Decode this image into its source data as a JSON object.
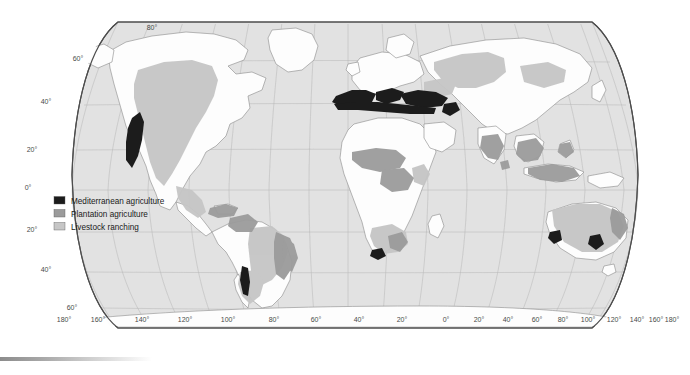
{
  "map": {
    "title": "World agricultural regions",
    "projection": "Robinson",
    "colors": {
      "ocean": "#e2e2e2",
      "land": "#fdfdfd",
      "border": "#8a8a8a",
      "graticule": "#b9b9b9",
      "frame": "#4d4d4d",
      "mediterranean": "#1c1c1c",
      "plantation": "#9b9b9b",
      "ranching": "#c6c6c6"
    },
    "legend": {
      "items": [
        {
          "label": "Mediterranean agriculture",
          "color": "#1c1c1c",
          "key": "mediterranean"
        },
        {
          "label": "Plantation agriculture",
          "color": "#9b9b9b",
          "key": "plantation"
        },
        {
          "label": "Livestock ranching",
          "color": "#c6c6c6",
          "key": "ranching"
        }
      ]
    },
    "latitude_labels": [
      {
        "text": "80°",
        "x": 152,
        "y": 30
      },
      {
        "text": "60°",
        "x": 78,
        "y": 61
      },
      {
        "text": "40°",
        "x": 46,
        "y": 104
      },
      {
        "text": "20°",
        "x": 32,
        "y": 152
      },
      {
        "text": "0°",
        "x": 28,
        "y": 190
      },
      {
        "text": "20°",
        "x": 32,
        "y": 232
      },
      {
        "text": "40°",
        "x": 46,
        "y": 272
      },
      {
        "text": "60°",
        "x": 72,
        "y": 310
      }
    ],
    "longitude_labels": [
      {
        "text": "180°",
        "x": 64,
        "y": 322
      },
      {
        "text": "160°",
        "x": 98,
        "y": 322
      },
      {
        "text": "140°",
        "x": 142,
        "y": 322
      },
      {
        "text": "120°",
        "x": 185,
        "y": 322
      },
      {
        "text": "100°",
        "x": 228,
        "y": 322
      },
      {
        "text": "80°",
        "x": 274,
        "y": 322
      },
      {
        "text": "60°",
        "x": 316,
        "y": 322
      },
      {
        "text": "40°",
        "x": 359,
        "y": 322
      },
      {
        "text": "20°",
        "x": 402,
        "y": 322
      },
      {
        "text": "0°",
        "x": 446,
        "y": 322
      },
      {
        "text": "20°",
        "x": 479,
        "y": 322
      },
      {
        "text": "40°",
        "x": 508,
        "y": 322
      },
      {
        "text": "60°",
        "x": 537,
        "y": 322
      },
      {
        "text": "80°",
        "x": 563,
        "y": 322
      },
      {
        "text": "100°",
        "x": 588,
        "y": 322
      },
      {
        "text": "120°",
        "x": 614,
        "y": 322
      },
      {
        "text": "140°",
        "x": 637,
        "y": 322
      },
      {
        "text": "160°",
        "x": 656,
        "y": 322
      },
      {
        "text": "180°",
        "x": 672,
        "y": 322
      }
    ]
  }
}
